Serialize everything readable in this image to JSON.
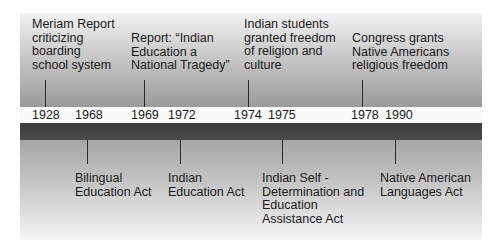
{
  "timeline": {
    "above": [
      {
        "year": "1928",
        "label": "Meriam Report\ncriticizing\nboarding\nschool system",
        "text_x": 32,
        "text_y": 18,
        "tick_x": 45
      },
      {
        "year": "1969",
        "label": "Report: “Indian\nEducation a\nNational Tragedy”",
        "text_x": 131,
        "text_y": 32,
        "tick_x": 144
      },
      {
        "year": "1974",
        "label": "Indian students\ngranted freedom\nof religion and\nculture",
        "text_x": 244,
        "text_y": 18,
        "tick_x": 248
      },
      {
        "year": "1978",
        "label": "Congress grants\nNative Americans\nreligious freedom",
        "text_x": 352,
        "text_y": 32,
        "tick_x": 362
      }
    ],
    "below": [
      {
        "year": "1968",
        "label": "Bilingual\nEducation Act",
        "text_x": 75,
        "text_y": 172,
        "tick_x": 87
      },
      {
        "year": "1972",
        "label": "Indian\nEducation Act",
        "text_x": 168,
        "text_y": 172,
        "tick_x": 180
      },
      {
        "year": "1975",
        "label": "Indian Self -\nDetermination and\nEducation\nAssistance Act",
        "text_x": 262,
        "text_y": 172,
        "tick_x": 282
      },
      {
        "year": "1990",
        "label": "Native American\nLanguages Act",
        "text_x": 380,
        "text_y": 172,
        "tick_x": 395
      }
    ],
    "years": [
      {
        "label": "1928",
        "x": 32
      },
      {
        "label": "1968",
        "x": 75
      },
      {
        "label": "1969",
        "x": 131
      },
      {
        "label": "1972",
        "x": 168
      },
      {
        "label": "1974",
        "x": 234
      },
      {
        "label": "1975",
        "x": 268
      },
      {
        "label": "1978",
        "x": 351
      },
      {
        "label": "1990",
        "x": 385
      }
    ]
  },
  "colors": {
    "dark_bar": "#444444",
    "tick": "#2a2a2a",
    "text": "#1a1a1a"
  }
}
